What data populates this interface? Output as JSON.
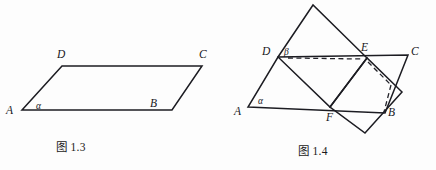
{
  "page": {
    "background_color": "#fdfdfd",
    "ink_color": "#1c1c22",
    "width": 436,
    "height": 170
  },
  "figures": [
    {
      "id": "fig-1-3",
      "caption": "图 1.3",
      "description": "parallelogram ABCD drawn in perspective with angle alpha at vertex A",
      "vertex_labels": {
        "A": "A",
        "B": "B",
        "C": "C",
        "D": "D"
      },
      "angle_labels": {
        "alpha": "α"
      },
      "vertices": {
        "A": [
          22,
          110
        ],
        "B": [
          172,
          110
        ],
        "C": [
          202,
          66
        ],
        "D": [
          62,
          66
        ]
      },
      "label_positions": {
        "A": [
          8,
          113
        ],
        "B": [
          150,
          107
        ],
        "C": [
          200,
          57
        ],
        "D": [
          58,
          57
        ],
        "alpha": [
          39,
          110
        ]
      }
    },
    {
      "id": "fig-1-4",
      "caption": "图 1.4",
      "description": "two intersecting parallelograms forming a dihedral angle along line DE; plane ABCD with angle alpha at A, plane DEF-folded with angle beta at D, dashed hidden edges",
      "vertex_labels": {
        "A": "A",
        "B": "B",
        "C": "C",
        "D": "D",
        "E": "E",
        "F": "F"
      },
      "angle_labels": {
        "alpha": "α",
        "beta": "β"
      },
      "vertices": {
        "A": [
          248,
          107
        ],
        "B": [
          385,
          113
        ],
        "C": [
          408,
          55
        ],
        "D": [
          278,
          57
        ],
        "E": [
          367,
          58
        ],
        "F": [
          330,
          107
        ],
        "T": [
          313,
          5
        ],
        "U": [
          365,
          133
        ]
      },
      "label_positions": {
        "A": [
          236,
          114
        ],
        "B": [
          388,
          114
        ],
        "C": [
          412,
          54
        ],
        "D": [
          264,
          55
        ],
        "E": [
          362,
          50
        ],
        "F": [
          327,
          118
        ],
        "alpha": [
          261,
          102
        ],
        "beta": [
          285,
          53
        ]
      },
      "dashed_edges": [
        "D-E",
        "E-B-hidden-quad"
      ]
    }
  ]
}
